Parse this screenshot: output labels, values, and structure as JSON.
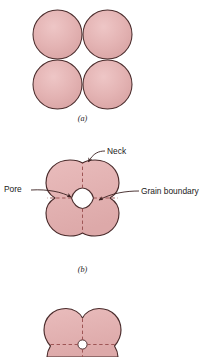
{
  "figure": {
    "kind": "sintering-stages-diagram",
    "background_color": "#ffffff",
    "particle_fill": "#e2b0b0",
    "particle_fill_light": "#e8bcbc",
    "outline_color": "#4a2c2c",
    "dashed_color": "#8a4a4a",
    "pore_fill": "#ffffff",
    "text_color": "#1a1a1a"
  },
  "panels": [
    {
      "id": "panel-a",
      "label": "(a)",
      "description": "Four loose spherical powder particles in point contact",
      "particle_count": 4
    },
    {
      "id": "panel-b",
      "label": "(b)",
      "description": "Particles coalesced into cloverleaf with necks and central pore",
      "particle_count": 4
    },
    {
      "id": "panel-c",
      "label": "",
      "description": "Further densification, small rounded pore remaining",
      "particle_count": 4
    }
  ],
  "callouts": [
    {
      "id": "neck",
      "label": "Neck",
      "text_x": 107,
      "text_y": 152
    },
    {
      "id": "pore",
      "label": "Pore",
      "text_x": 4,
      "text_y": 192
    },
    {
      "id": "grain-boundary",
      "label": "Grain boundary",
      "text_x": 141,
      "text_y": 194
    }
  ]
}
